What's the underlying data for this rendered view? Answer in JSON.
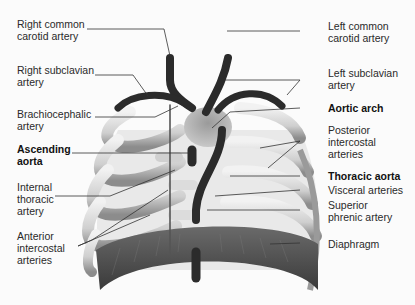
{
  "figure": {
    "labels_left": [
      {
        "id": "right-common-carotid",
        "text": "Right common\ncarotid artery",
        "bold": false
      },
      {
        "id": "right-subclavian",
        "text": "Right subclavian\nartery",
        "bold": false
      },
      {
        "id": "brachiocephalic",
        "text": "Brachiocephalic\nartery",
        "bold": false
      },
      {
        "id": "ascending-aorta",
        "text": "Ascending\naorta",
        "bold": true
      },
      {
        "id": "internal-thoracic",
        "text": "Internal\nthoracic\nartery",
        "bold": false
      },
      {
        "id": "anterior-intercostal",
        "text": "Anterior\nintercostal\narteries",
        "bold": false
      }
    ],
    "labels_right": [
      {
        "id": "left-common-carotid",
        "text": "Left common\ncarotid artery",
        "bold": false
      },
      {
        "id": "left-subclavian",
        "text": "Left subclavian\nartery",
        "bold": false
      },
      {
        "id": "aortic-arch",
        "text": "Aortic arch",
        "bold": true
      },
      {
        "id": "posterior-intercostal",
        "text": "Posterior\nintercostal\narteries",
        "bold": false
      },
      {
        "id": "thoracic-aorta",
        "text": "Thoracic aorta",
        "bold": true
      },
      {
        "id": "visceral-arteries",
        "text": "Visceral arteries",
        "bold": false
      },
      {
        "id": "superior-phrenic",
        "text": "Superior\nphrenic artery",
        "bold": false
      },
      {
        "id": "diaphragm",
        "text": "Diaphragm",
        "bold": false
      }
    ],
    "colors": {
      "artery": "#2b2b2b",
      "rib": "#d9d9d9",
      "rib_shadow": "#8a8a8a",
      "diaphragm": "#4a4a4a",
      "heart": "#a8a8a8",
      "leader": "#333333"
    }
  }
}
